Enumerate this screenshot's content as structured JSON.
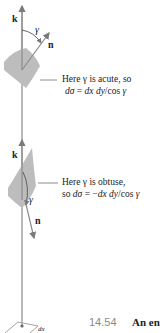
{
  "figure": {
    "top_panel": {
      "vector_k": "k",
      "vector_n": "n",
      "angle": "γ",
      "annotation_line1": "Here γ is acute, so",
      "annotation_line2": "dσ = dx dy/cos γ"
    },
    "bottom_panel": {
      "vector_k": "k",
      "vector_n": "n",
      "angle": "γ",
      "annotation_line1": "Here γ is obtuse,",
      "annotation_line2": "so dσ = −dx dy/cos γ"
    },
    "base": {
      "label": "dx"
    },
    "caption": {
      "number": "14.54",
      "text": "An en"
    },
    "colors": {
      "axis": "#8c8c8c",
      "patch": "#b8b8b8",
      "text": "#1a1a1a",
      "caption_number": "#8a8a8a"
    }
  }
}
